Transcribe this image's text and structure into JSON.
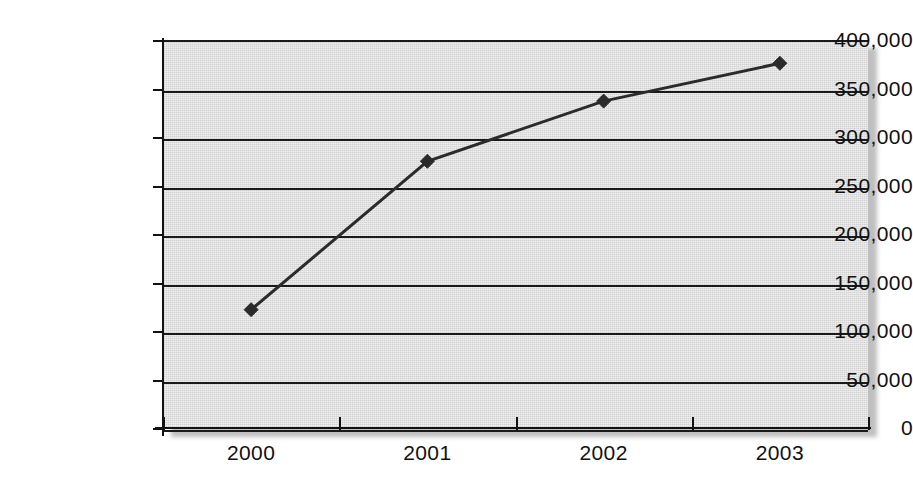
{
  "chart_data": {
    "type": "line",
    "title": "",
    "xlabel": "",
    "ylabel": "",
    "categories": [
      "2000",
      "2001",
      "2002",
      "2003"
    ],
    "values": [
      122000,
      275000,
      337000,
      376000
    ],
    "series": [
      {
        "name": "",
        "values": [
          122000,
          275000,
          337000,
          376000
        ]
      }
    ],
    "ylim": [
      0,
      400000
    ],
    "y_ticks": [
      0,
      50000,
      100000,
      150000,
      200000,
      250000,
      300000,
      350000,
      400000
    ],
    "y_tick_labels": [
      "0",
      "50,000",
      "100,000",
      "150,000",
      "200,000",
      "250,000",
      "300,000",
      "350,000",
      "400,000"
    ],
    "x_tick_labels": [
      "2000",
      "2001",
      "2002",
      "2003"
    ],
    "grid": true,
    "grid_axis": "y",
    "legend": false,
    "legend_position": "none",
    "marker": "diamond",
    "plot_background": "#d2d2d2",
    "line_color": "#2b2b2b",
    "axis_color": "#111111",
    "figure_background": "#ffffff"
  },
  "figure": {
    "title_partial": "",
    "title_visible": false
  }
}
